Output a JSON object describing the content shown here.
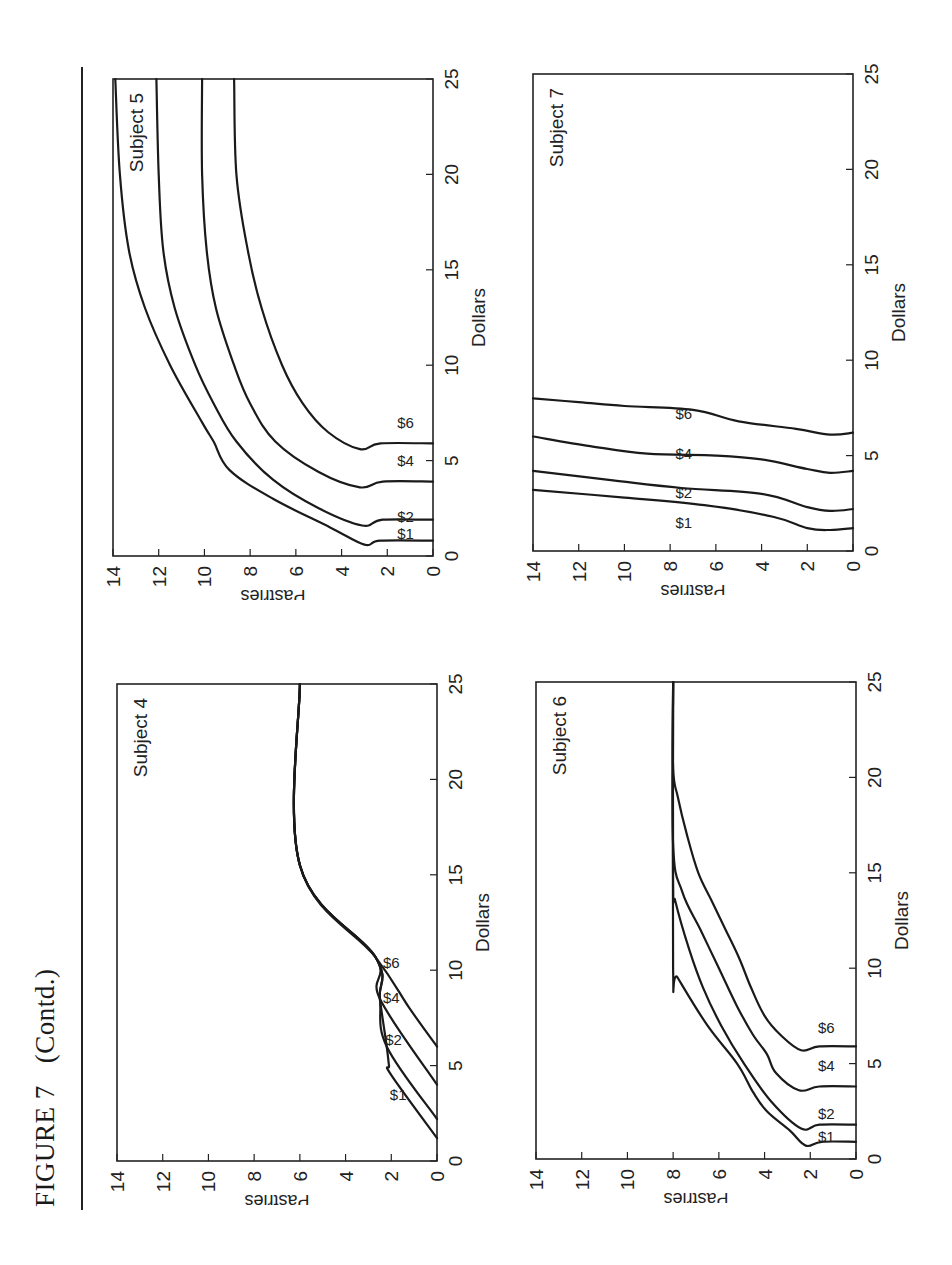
{
  "figure": {
    "title": "FIGURE 7",
    "subtitle": "(Contd.)"
  },
  "chart_data": [
    {
      "type": "line",
      "title": "Subject 4",
      "xlabel": "Dollars",
      "ylabel": "Pastries",
      "xlim": [
        0,
        25
      ],
      "ylim": [
        0,
        14
      ],
      "xticks": [
        0,
        5,
        10,
        15,
        20,
        25
      ],
      "yticks": [
        0,
        2,
        4,
        6,
        8,
        10,
        12,
        14
      ],
      "grid": false,
      "series": [
        {
          "name": "$1",
          "points": [
            [
              1.2,
              0
            ],
            [
              4.5,
              2.0
            ],
            [
              5.0,
              2.1
            ],
            [
              6.0,
              2.2
            ],
            [
              8.5,
              2.5
            ],
            [
              10.7,
              2.7
            ],
            [
              15.5,
              6.0
            ],
            [
              25,
              6.0
            ]
          ]
        },
        {
          "name": "$2",
          "points": [
            [
              2.2,
              0
            ],
            [
              6.0,
              2.2
            ],
            [
              8.5,
              2.5
            ],
            [
              10.7,
              2.7
            ],
            [
              15.5,
              6.0
            ],
            [
              25,
              6.0
            ]
          ]
        },
        {
          "name": "$4",
          "points": [
            [
              4.0,
              0
            ],
            [
              8.5,
              2.5
            ],
            [
              10.7,
              2.7
            ],
            [
              15.5,
              6.0
            ],
            [
              25,
              6.0
            ]
          ]
        },
        {
          "name": "$6",
          "points": [
            [
              6.0,
              0
            ],
            [
              8.0,
              1.2
            ],
            [
              10.7,
              2.7
            ],
            [
              15.5,
              6.0
            ],
            [
              25,
              6.0
            ]
          ]
        }
      ],
      "labels": [
        {
          "text": "$1",
          "x": 3.2,
          "y": 1.7
        },
        {
          "text": "$2",
          "x": 6.1,
          "y": 1.9
        },
        {
          "text": "$4",
          "x": 8.3,
          "y": 2.0
        },
        {
          "text": "$6",
          "x": 10.1,
          "y": 2.0
        }
      ]
    },
    {
      "type": "line",
      "title": "Subject 5",
      "xlabel": "Dollars",
      "ylabel": "Pastries",
      "xlim": [
        0,
        25
      ],
      "ylim": [
        0,
        14
      ],
      "xticks": [
        0,
        5,
        10,
        15,
        20,
        25
      ],
      "yticks": [
        0,
        2,
        4,
        6,
        8,
        10,
        12,
        14
      ],
      "grid": false,
      "series": [
        {
          "name": "$1",
          "points": [
            [
              0.8,
              0
            ],
            [
              0.8,
              2.3
            ],
            [
              0.6,
              3.0
            ],
            [
              1.5,
              4.5
            ],
            [
              3.0,
              7.0
            ],
            [
              4.5,
              8.9
            ],
            [
              6,
              9.6
            ],
            [
              7,
              10.1
            ],
            [
              10,
              11.5
            ],
            [
              13,
              12.6
            ],
            [
              16,
              13.3
            ],
            [
              20,
              13.7
            ],
            [
              25,
              13.9
            ]
          ]
        },
        {
          "name": "$2",
          "points": [
            [
              1.9,
              0
            ],
            [
              1.9,
              2.2
            ],
            [
              1.6,
              3.1
            ],
            [
              2.5,
              5.0
            ],
            [
              4,
              7.0
            ],
            [
              6,
              8.6
            ],
            [
              8,
              9.6
            ],
            [
              10,
              10.4
            ],
            [
              13,
              11.3
            ],
            [
              16,
              11.8
            ],
            [
              20,
              12.0
            ],
            [
              25,
              12.1
            ]
          ]
        },
        {
          "name": "$4",
          "points": [
            [
              3.9,
              0
            ],
            [
              3.9,
              2.2
            ],
            [
              3.6,
              3.2
            ],
            [
              4.4,
              5.0
            ],
            [
              6,
              6.9
            ],
            [
              8,
              8.0
            ],
            [
              10,
              8.7
            ],
            [
              13,
              9.5
            ],
            [
              16,
              9.9
            ],
            [
              20,
              10.1
            ],
            [
              25,
              10.1
            ]
          ]
        },
        {
          "name": "$6",
          "points": [
            [
              5.9,
              0
            ],
            [
              5.9,
              2.3
            ],
            [
              5.6,
              3.2
            ],
            [
              6.5,
              4.6
            ],
            [
              8,
              5.7
            ],
            [
              10,
              6.6
            ],
            [
              13,
              7.5
            ],
            [
              16,
              8.1
            ],
            [
              20,
              8.6
            ],
            [
              25,
              8.7
            ]
          ]
        }
      ],
      "labels": [
        {
          "text": "$1",
          "x": 0.9,
          "y": 1.2
        },
        {
          "text": "$2",
          "x": 1.8,
          "y": 1.2
        },
        {
          "text": "$4",
          "x": 4.7,
          "y": 1.2
        },
        {
          "text": "$6",
          "x": 6.7,
          "y": 1.2
        }
      ]
    },
    {
      "type": "line",
      "title": "Subject 6",
      "xlabel": "Dollars",
      "ylabel": "Pastries",
      "xlim": [
        0,
        25
      ],
      "ylim": [
        0,
        14
      ],
      "xticks": [
        0,
        5,
        10,
        15,
        20,
        25
      ],
      "yticks": [
        0,
        2,
        4,
        6,
        8,
        10,
        12,
        14
      ],
      "grid": false,
      "series": [
        {
          "name": "$1",
          "points": [
            [
              0.9,
              0
            ],
            [
              0.9,
              1.5
            ],
            [
              0.7,
              2.2
            ],
            [
              1.5,
              2.9
            ],
            [
              2.5,
              3.9
            ],
            [
              3.5,
              4.5
            ],
            [
              5,
              5.2
            ],
            [
              7,
              6.5
            ],
            [
              9.5,
              7.8
            ],
            [
              10,
              8.0
            ],
            [
              25,
              8.0
            ]
          ]
        },
        {
          "name": "$2",
          "points": [
            [
              1.8,
              0
            ],
            [
              1.8,
              1.6
            ],
            [
              1.6,
              2.4
            ],
            [
              3,
              3.7
            ],
            [
              5,
              4.9
            ],
            [
              7,
              5.9
            ],
            [
              9,
              6.7
            ],
            [
              11,
              7.3
            ],
            [
              13.5,
              7.9
            ],
            [
              14.5,
              8.0
            ],
            [
              25,
              8.0
            ]
          ]
        },
        {
          "name": "$4",
          "points": [
            [
              3.8,
              0
            ],
            [
              3.8,
              1.6
            ],
            [
              3.6,
              2.5
            ],
            [
              4.5,
              3.5
            ],
            [
              5.5,
              3.9
            ],
            [
              6.5,
              4.5
            ],
            [
              8,
              5.2
            ],
            [
              10,
              6.0
            ],
            [
              12,
              6.8
            ],
            [
              14,
              7.6
            ],
            [
              16.5,
              8.0
            ],
            [
              25,
              8.0
            ]
          ]
        },
        {
          "name": "$6",
          "points": [
            [
              5.9,
              0
            ],
            [
              5.9,
              1.6
            ],
            [
              5.7,
              2.4
            ],
            [
              6.5,
              3.3
            ],
            [
              7.5,
              4.0
            ],
            [
              9,
              4.6
            ],
            [
              10.5,
              5.1
            ],
            [
              12,
              5.7
            ],
            [
              13.5,
              6.3
            ],
            [
              15,
              6.9
            ],
            [
              17,
              7.4
            ],
            [
              19,
              7.8
            ],
            [
              20.5,
              8.0
            ],
            [
              25,
              8.0
            ]
          ]
        }
      ],
      "labels": [
        {
          "text": "$1",
          "x": 0.9,
          "y": 1.3
        },
        {
          "text": "$2",
          "x": 2.1,
          "y": 1.3
        },
        {
          "text": "$4",
          "x": 4.6,
          "y": 1.3
        },
        {
          "text": "$6",
          "x": 6.6,
          "y": 1.3
        }
      ]
    },
    {
      "type": "line",
      "title": "Subject 7",
      "xlabel": "Dollars",
      "ylabel": "Pastries",
      "xlim": [
        0,
        25
      ],
      "ylim": [
        0,
        14
      ],
      "xticks": [
        0,
        5,
        10,
        15,
        20,
        25
      ],
      "yticks": [
        0,
        2,
        4,
        6,
        8,
        10,
        12,
        14
      ],
      "grid": false,
      "series": [
        {
          "name": "$1",
          "points": [
            [
              1.2,
              0
            ],
            [
              1.1,
              1.0
            ],
            [
              1.2,
              2.0
            ],
            [
              1.8,
              3.5
            ],
            [
              2.4,
              6.5
            ],
            [
              2.8,
              10.0
            ],
            [
              3.2,
              14.0
            ]
          ]
        },
        {
          "name": "$2",
          "points": [
            [
              2.2,
              0
            ],
            [
              2.1,
              1.0
            ],
            [
              2.3,
              2.0
            ],
            [
              3.0,
              4.0
            ],
            [
              3.3,
              7.5
            ],
            [
              3.7,
              10.5
            ],
            [
              4.2,
              14.0
            ]
          ]
        },
        {
          "name": "$4",
          "points": [
            [
              4.2,
              0
            ],
            [
              4.1,
              1.0
            ],
            [
              4.3,
              2.0
            ],
            [
              4.8,
              4.0
            ],
            [
              5.0,
              6.0
            ],
            [
              5.1,
              9.0
            ],
            [
              5.5,
              11.5
            ],
            [
              6.0,
              14.0
            ]
          ]
        },
        {
          "name": "$6",
          "points": [
            [
              6.2,
              0
            ],
            [
              6.1,
              1.0
            ],
            [
              6.4,
              2.5
            ],
            [
              6.8,
              5.0
            ],
            [
              7.4,
              7.0
            ],
            [
              7.6,
              10.0
            ],
            [
              7.8,
              12.0
            ],
            [
              8.0,
              14.0
            ]
          ]
        }
      ],
      "labels": [
        {
          "text": "$1",
          "x": 1.2,
          "y": 7.4
        },
        {
          "text": "$2",
          "x": 2.8,
          "y": 7.4
        },
        {
          "text": "$4",
          "x": 4.8,
          "y": 7.4
        },
        {
          "text": "$6",
          "x": 6.9,
          "y": 7.4
        }
      ]
    }
  ]
}
